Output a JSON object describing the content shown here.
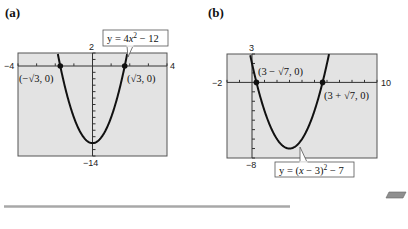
{
  "chart_data": [
    {
      "type": "line",
      "panel": "(a)",
      "title": "",
      "equation": "y = 4x^2 - 12",
      "equation_display": [
        "y = 4",
        "x",
        "2",
        " − 12"
      ],
      "xlim": [
        -4,
        4
      ],
      "ylim": [
        -14,
        2
      ],
      "x_tick_labels": {
        "left": "−4",
        "right": "4"
      },
      "y_tick_labels": {
        "top": "2",
        "bottom": "−14"
      },
      "x_scale_ticks": 1,
      "y_scale_ticks": 1,
      "grid": false,
      "series": [
        {
          "name": "y = 4x^2 - 12",
          "function": "4*x*x-12",
          "vertex": [
            0,
            -12
          ]
        }
      ],
      "points": [
        {
          "label": "(−√3, 0)",
          "x": -1.732,
          "y": 0
        },
        {
          "label": "(√3, 0)",
          "x": 1.732,
          "y": 0
        }
      ]
    },
    {
      "type": "line",
      "panel": "(b)",
      "title": "",
      "equation": "y = (x - 3)^2 - 7",
      "xlim": [
        -2,
        10
      ],
      "ylim": [
        -8,
        3
      ],
      "x_tick_labels": {
        "left": "−2",
        "right": "10"
      },
      "y_tick_labels": {
        "top": "3",
        "bottom": "−8"
      },
      "x_scale_ticks": 1,
      "y_scale_ticks": 1,
      "grid": false,
      "series": [
        {
          "name": "y = (x - 3)^2 - 7",
          "function": "(x-3)*(x-3)-7",
          "vertex": [
            3,
            -7
          ]
        }
      ],
      "points": [
        {
          "label": "(3 − √7, 0)",
          "x": 0.354,
          "y": 0
        },
        {
          "label": "(3 + √7, 0)",
          "x": 5.646,
          "y": 0
        }
      ]
    }
  ],
  "panels": {
    "a": {
      "label": "(a)",
      "x_min_label": "−4",
      "x_max_label": "4",
      "y_max_label": "2",
      "y_min_label": "−14",
      "eq_prefix": "y = 4",
      "eq_var": "x",
      "eq_exp": "2",
      "eq_suffix": " − 12",
      "pt_left": "(−√3, 0)",
      "pt_right": "(√3, 0)"
    },
    "b": {
      "label": "(b)",
      "x_min_label": "−2",
      "x_max_label": "10",
      "y_max_label": "3",
      "y_min_label": "−8",
      "eq_prefix": "y = (",
      "eq_var": "x",
      "eq_mid": " − 3)",
      "eq_exp": "2",
      "eq_suffix": " − 7",
      "pt_left": "(3 − √7, 0)",
      "pt_right": "(3 + √7, 0)"
    }
  },
  "colors": {
    "plot_bg": "#e3e3e3",
    "curve": "#111111",
    "frame": "#555555",
    "rule": "#a8a8a8",
    "parallelogram": "#8f8f8f"
  }
}
